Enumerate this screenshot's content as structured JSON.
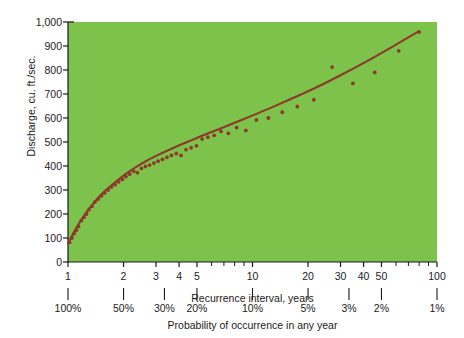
{
  "chart_data": {
    "type": "scatter",
    "title": "",
    "xlabel": "Recurrence interval, years",
    "xlabel_secondary": "Probability of occurrence in any year",
    "ylabel": "Discharge, cu. ft./sec.",
    "xscale": "log",
    "yscale": "linear",
    "xlim": [
      1,
      100
    ],
    "ylim": [
      0,
      1000
    ],
    "grid": false,
    "legend": null,
    "plot_bg_color": "#7DC24B",
    "data_color": "#8B3A2A",
    "page_bg_color": "#FFFFFF",
    "ytick_labels": [
      "0",
      "100",
      "200",
      "300",
      "400",
      "500",
      "600",
      "700",
      "800",
      "900",
      "1,000"
    ],
    "ytick_values": [
      0,
      100,
      200,
      300,
      400,
      500,
      600,
      700,
      800,
      900,
      1000
    ],
    "xtick_labels": [
      "1",
      "2",
      "3",
      "4",
      "5",
      "10",
      "20",
      "30",
      "40",
      "50",
      "100"
    ],
    "xtick_values": [
      1,
      2,
      3,
      4,
      5,
      10,
      20,
      30,
      40,
      50,
      100
    ],
    "xminor_values": [
      6,
      7,
      8,
      9,
      60,
      70,
      80,
      90
    ],
    "probability_tick_labels": [
      "100%",
      "50%",
      "30%",
      "20%",
      "10%",
      "5%",
      "3%",
      "2%",
      "1%"
    ],
    "probability_tick_positions": [
      1,
      2,
      3.333,
      5,
      10,
      20,
      33.333,
      50,
      100
    ],
    "series": [
      {
        "name": "Annual peak discharge observations",
        "type": "scatter",
        "x": [
          1.02,
          1.04,
          1.06,
          1.08,
          1.1,
          1.12,
          1.15,
          1.18,
          1.21,
          1.24,
          1.28,
          1.32,
          1.36,
          1.4,
          1.45,
          1.5,
          1.56,
          1.62,
          1.68,
          1.75,
          1.82,
          1.9,
          1.98,
          2.07,
          2.16,
          2.26,
          2.37,
          2.48,
          2.6,
          2.73,
          2.87,
          3.02,
          3.18,
          3.35,
          3.54,
          3.75,
          3.97,
          4.22,
          4.5,
          4.8,
          5.2,
          5.7,
          6.3,
          7.0,
          7.9,
          9.0,
          10.5,
          12.5,
          15.0,
          18.5,
          23.0,
          30.0,
          40.0,
          55.0,
          80.0
        ],
        "y": [
          80,
          95,
          110,
          125,
          140,
          152,
          168,
          182,
          196,
          208,
          222,
          236,
          248,
          258,
          272,
          285,
          297,
          308,
          318,
          330,
          340,
          349,
          358,
          367,
          375,
          383,
          390,
          398,
          405,
          412,
          419,
          426,
          432,
          439,
          446,
          452,
          459,
          466,
          473,
          480,
          492,
          505,
          520,
          535,
          550,
          566,
          586,
          612,
          640,
          672,
          707,
          755,
          812,
          880,
          960
        ],
        "scatter_x": [
          1.02,
          1.05,
          1.08,
          1.11,
          1.14,
          1.18,
          1.22,
          1.26,
          1.3,
          1.35,
          1.4,
          1.46,
          1.52,
          1.58,
          1.65,
          1.72,
          1.8,
          1.88,
          1.97,
          2.06,
          2.16,
          2.27,
          2.38,
          2.5,
          2.63,
          2.77,
          2.92,
          3.08,
          3.25,
          3.44,
          3.64,
          3.86,
          4.1,
          4.36,
          4.65,
          4.97,
          5.33,
          5.73,
          6.2,
          6.75,
          7.4,
          8.2,
          9.2,
          10.5,
          12.2,
          14.5,
          17.5,
          21.5,
          27.0,
          35.0,
          46.0,
          62.0,
          80.0
        ],
        "scatter_y": [
          82,
          100,
          118,
          132,
          148,
          172,
          186,
          200,
          218,
          232,
          250,
          262,
          276,
          288,
          300,
          312,
          322,
          334,
          344,
          356,
          366,
          378,
          372,
          390,
          398,
          404,
          412,
          420,
          428,
          436,
          444,
          452,
          444,
          468,
          476,
          484,
          512,
          520,
          528,
          544,
          536,
          560,
          548,
          592,
          600,
          624,
          648,
          676,
          812,
          744,
          790,
          880,
          958
        ]
      },
      {
        "name": "Fitted frequency curve",
        "type": "line",
        "x": [
          1.0,
          1.05,
          1.1,
          1.2,
          1.3,
          1.4,
          1.5,
          1.7,
          2.0,
          2.3,
          2.7,
          3.2,
          3.8,
          4.5,
          5.5,
          7.0,
          9.0,
          12.0,
          16.0,
          22.0,
          30.0,
          42.0,
          60.0,
          80.0
        ],
        "y": [
          78,
          108,
          138,
          184,
          222,
          252,
          278,
          316,
          360,
          392,
          424,
          452,
          478,
          502,
          530,
          562,
          596,
          636,
          678,
          726,
          778,
          838,
          906,
          962
        ]
      }
    ]
  }
}
